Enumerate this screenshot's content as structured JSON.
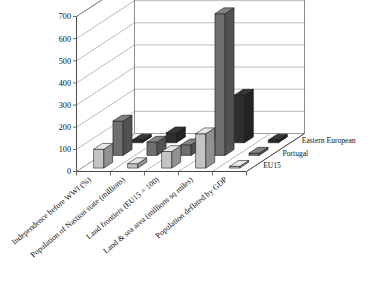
{
  "chart_data": {
    "type": "bar",
    "render": "3d-grouped-bar",
    "title": "",
    "subtitle": "",
    "xlabel": "",
    "ylabel": "",
    "zlabel": "",
    "ylim": [
      0,
      700
    ],
    "yticks": [
      0,
      100,
      200,
      300,
      400,
      500,
      600,
      700
    ],
    "ytick_labels": [
      "0",
      "100",
      "200",
      "300",
      "400",
      "500",
      "600",
      "700"
    ],
    "grid": true,
    "legend_position": "right",
    "categories": [
      "Independence before WWI (%)",
      "Population of Nastion state (millions)",
      "Land frontiers (EU15 = 100)",
      "Land & sea area (millions sq miles)",
      "Population deflated by GDP"
    ],
    "series": [
      {
        "name": "EU15",
        "color": "#c4c4c4",
        "values": [
          85,
          20,
          75,
          155,
          8
        ]
      },
      {
        "name": "Portugal",
        "color": "#6f6f6f",
        "values": [
          155,
          60,
          48,
          640,
          10
        ]
      },
      {
        "name": "Eastern European",
        "color": "#2e2e2e",
        "values": [
          12,
          45,
          35,
          215,
          12
        ]
      }
    ],
    "legend_entries": [
      "Eastern European",
      "Portugal",
      "EU15"
    ],
    "colors": {
      "eu15": "#c4c4c4",
      "portugal": "#6f6f6f",
      "eastern_european": "#2e2e2e",
      "grid": "#8c8c8c",
      "axis": "#4a4a4a",
      "text": "#111111",
      "background": "#ffffff"
    }
  }
}
